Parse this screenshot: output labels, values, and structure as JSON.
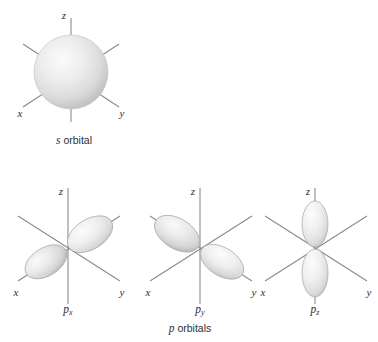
{
  "figure": {
    "background_color": "#ffffff",
    "axis_color": "#8a8a8a",
    "lobe_fill_light": "#f4f4f4",
    "lobe_fill_mid": "#dcdcdc",
    "lobe_fill_dark": "#b9b9b9",
    "lobe_stroke": "#9b9b9b",
    "sphere_fill_light": "#f2f2f2",
    "sphere_fill_mid": "#dedede",
    "sphere_fill_dark": "#bdbdbd",
    "label_color": "#2f2f2f"
  },
  "axes": {
    "z_label": "z",
    "x_label": "x",
    "y_label": "y"
  },
  "orbitals": [
    {
      "id": "s",
      "type": "sphere",
      "caption_italic": "s",
      "caption_roman": " orbital",
      "subscript": ""
    },
    {
      "id": "px",
      "type": "lobes",
      "orientation": "x-axis",
      "caption_italic": "p",
      "caption_roman": "",
      "subscript": "x"
    },
    {
      "id": "py",
      "type": "lobes",
      "orientation": "y-axis",
      "caption_italic": "p",
      "caption_roman": "",
      "subscript": "y"
    },
    {
      "id": "pz",
      "type": "lobes",
      "orientation": "z-axis",
      "caption_italic": "p",
      "caption_roman": "",
      "subscript": "z"
    }
  ],
  "group_caption": {
    "italic": "p",
    "roman": " orbitals"
  }
}
